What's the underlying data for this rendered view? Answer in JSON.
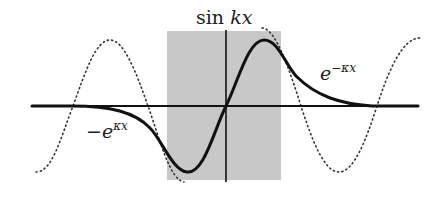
{
  "figure": {
    "labels": {
      "inside": {
        "func": "sin",
        "arg": "kx"
      },
      "right": {
        "base": "e",
        "exponent": "−κx"
      },
      "left": {
        "sign": "−",
        "base": "e",
        "exponent": "κx"
      }
    },
    "colors": {
      "background": "#ffffff",
      "well_fill": "#c8c8c8",
      "solid_curve": "#111111",
      "dotted_curve": "#333333",
      "axes": "#111111"
    },
    "geometry": {
      "axis_y": 106,
      "axis_x_start": 32,
      "axis_x_end": 418,
      "vertical_axis_x": 226,
      "vertical_axis_top": 30,
      "vertical_axis_bottom": 182,
      "well": {
        "x": 167,
        "y": 31,
        "width": 114,
        "height": 149
      }
    }
  }
}
